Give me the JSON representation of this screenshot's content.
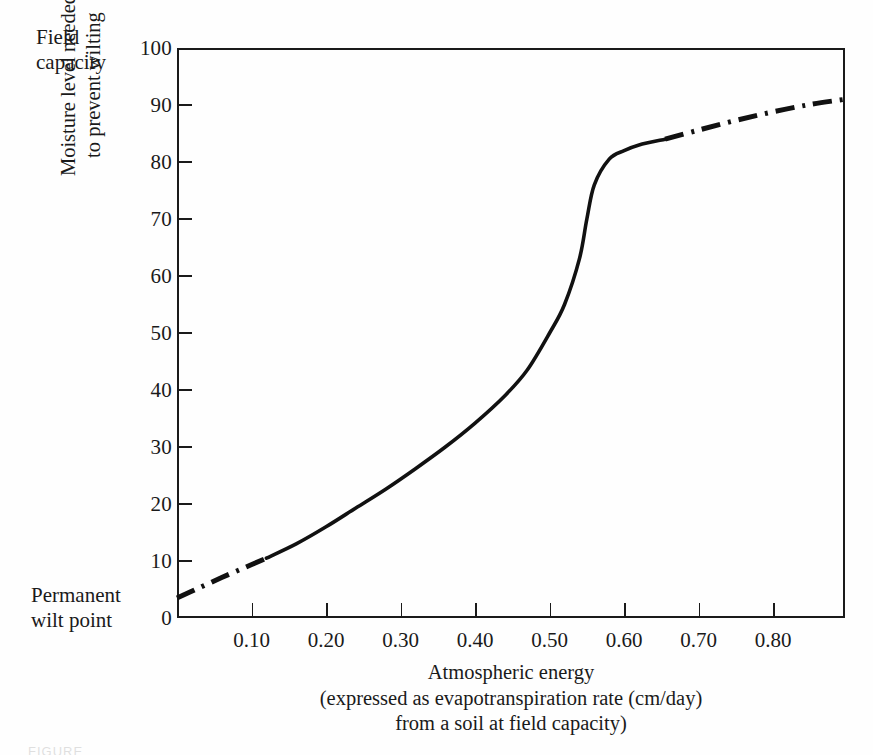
{
  "figure": {
    "background_color": "#fefefe",
    "ink_color": "#1a1a1a",
    "field_capacity_line1": "Field",
    "field_capacity_line2": "capacity",
    "wilt_point_line1": "Permanent",
    "wilt_point_line2": "wilt point",
    "caption_partial": "FIGURE"
  },
  "chart_data": {
    "type": "line",
    "title": "",
    "xlabel": "Atmospheric energy (expressed as evapotranspiration rate (cm/day) from a soil at field capacity)",
    "xlabel_line1": "Atmospheric energy",
    "xlabel_line2": "(expressed as evapotranspiration rate (cm/day)",
    "xlabel_line3": "from a soil at field capacity)",
    "ylabel": "Moisture level needed to prevent wilting",
    "ylabel_line1": "Moisture level needed",
    "ylabel_line2": "to prevent wilting",
    "xlim": [
      0.0,
      0.8964
    ],
    "ylim": [
      0,
      100
    ],
    "grid": false,
    "legend": "none",
    "xticks": [
      0.0,
      0.1,
      0.2,
      0.3,
      0.4,
      0.5,
      0.6,
      0.7,
      0.8,
      0.9
    ],
    "xtick_labels": [
      "",
      "0.10",
      "0.20",
      "0.30",
      "0.40",
      "0.50",
      "0.60",
      "0.70",
      "0.80",
      ""
    ],
    "yticks": [
      0,
      10,
      20,
      30,
      40,
      50,
      60,
      70,
      80,
      90,
      100
    ],
    "ytick_labels": [
      "0",
      "10",
      "20",
      "30",
      "40",
      "50",
      "60",
      "70",
      "80",
      "90",
      "100"
    ],
    "y_axis_top_annotation": "Field capacity",
    "y_axis_bottom_annotation": "Permanent wilt point",
    "series": [
      {
        "name": "Moisture level needed to prevent wilting",
        "style": "solid",
        "color": "#111111",
        "segment": "measured",
        "x": [
          0.12,
          0.16,
          0.2,
          0.24,
          0.28,
          0.32,
          0.36,
          0.4,
          0.44,
          0.47,
          0.5,
          0.52,
          0.54,
          0.55,
          0.56,
          0.58,
          0.6,
          0.62,
          0.655
        ],
        "y": [
          10.5,
          13.0,
          16.0,
          19.3,
          22.6,
          26.2,
          30.0,
          34.2,
          39.0,
          43.5,
          50.0,
          55.0,
          63.0,
          70.0,
          76.0,
          80.5,
          82.0,
          83.0,
          84.0
        ]
      },
      {
        "name": "Extrapolated lower range",
        "style": "dash-dot",
        "color": "#111111",
        "segment": "extrapolated",
        "x": [
          0.0,
          0.03,
          0.06,
          0.09,
          0.12
        ],
        "y": [
          3.5,
          5.3,
          7.1,
          8.8,
          10.5
        ]
      },
      {
        "name": "Extrapolated upper range",
        "style": "dash-dot",
        "color": "#111111",
        "segment": "extrapolated",
        "x": [
          0.655,
          0.7,
          0.75,
          0.8,
          0.85,
          0.8964
        ],
        "y": [
          84.0,
          85.6,
          87.3,
          88.8,
          90.1,
          91.0
        ]
      }
    ]
  }
}
